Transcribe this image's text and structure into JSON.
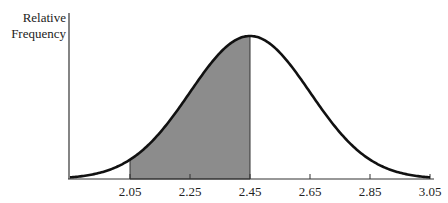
{
  "chart_data": {
    "type": "area",
    "title": "",
    "xlabel": "",
    "ylabel": "Relative Frequency",
    "ylabel_lines": [
      "Relative",
      "Frequency"
    ],
    "distribution": "normal",
    "mean": 2.45,
    "std": 0.2,
    "x_ticks": [
      2.05,
      2.25,
      2.45,
      2.65,
      2.85,
      3.05
    ],
    "x_tick_labels": [
      "2.05",
      "2.25",
      "2.45",
      "2.65",
      "2.85",
      "3.05"
    ],
    "xlim": [
      1.85,
      3.05
    ],
    "shaded_region": {
      "from": 2.05,
      "to": 2.45
    },
    "grid": false,
    "legend": null,
    "colors": {
      "curve": "#111111",
      "shade": "#8c8c8c",
      "axis": "#333333"
    }
  }
}
